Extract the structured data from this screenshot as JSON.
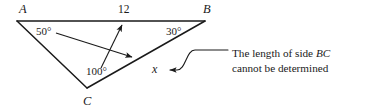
{
  "figure": {
    "type": "geometry-diagram",
    "shape": "triangle",
    "background_color": "#ffffff",
    "stroke_color": "#1a1a1a",
    "vertices": [
      {
        "name": "A",
        "label": "A",
        "x": 17,
        "y": 21,
        "label_x": 19,
        "label_y": 3
      },
      {
        "name": "B",
        "label": "B",
        "x": 205,
        "y": 21,
        "label_x": 203,
        "label_y": 3
      },
      {
        "name": "C",
        "label": "C",
        "x": 87,
        "y": 88,
        "label_x": 83,
        "label_y": 95
      }
    ],
    "angles": [
      {
        "at": "A",
        "label": "50°",
        "value": 50,
        "label_x": 36,
        "label_y": 26
      },
      {
        "at": "B",
        "label": "30°",
        "value": 30,
        "label_x": 166,
        "label_y": 26
      },
      {
        "at": "C",
        "label": "100°",
        "value": 100,
        "label_x": 86,
        "label_y": 66
      }
    ],
    "sides": [
      {
        "name": "AB",
        "label": "12",
        "value": 12,
        "label_x": 118,
        "label_y": 4
      },
      {
        "name": "BC",
        "label": "x",
        "value": null,
        "label_x": 152,
        "label_y": 63
      },
      {
        "name": "AC",
        "label": "",
        "value": null
      }
    ],
    "arrows": [
      {
        "name": "arrow-from-angle-A-to-side-BC",
        "x1": 56,
        "y1": 34,
        "x2": 130,
        "y2": 57
      },
      {
        "name": "arrow-from-angle-C-to-side-AB",
        "x1": 101,
        "y1": 67,
        "x2": 121,
        "y2": 24
      }
    ],
    "leader": {
      "name": "leader-line-to-x",
      "arrow_tip_x": 168,
      "arrow_tip_y": 70
    }
  },
  "annotation": {
    "line1_prefix": "The length of side ",
    "line1_italic": "BC",
    "line2": "cannot be determined",
    "full_text": "The length of side BC cannot be determined"
  }
}
